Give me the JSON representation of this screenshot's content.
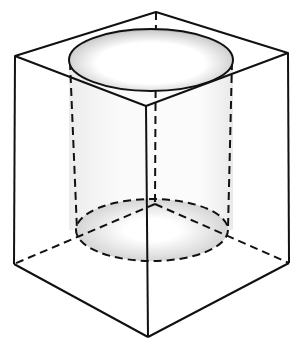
{
  "diagram": {
    "colors": {
      "stroke": "#111111",
      "shade": "#9a9a9a",
      "background": "#ffffff"
    },
    "cube_vertices": {
      "top_back": [
        156,
        12
      ],
      "top_left": [
        15,
        56
      ],
      "top_right": [
        288,
        53
      ],
      "top_front": [
        146,
        106
      ],
      "bottom_back": [
        155,
        204
      ],
      "bottom_left": [
        14,
        264
      ],
      "bottom_right": [
        289,
        263
      ],
      "bottom_front": [
        148,
        337
      ]
    },
    "cylinder": {
      "top_ellipse": {
        "cx": 151,
        "cy": 60,
        "rx": 82,
        "ry": 31
      },
      "bottom_ellipse": {
        "cx": 152,
        "cy": 230,
        "rx": 76,
        "ry": 31
      }
    }
  }
}
